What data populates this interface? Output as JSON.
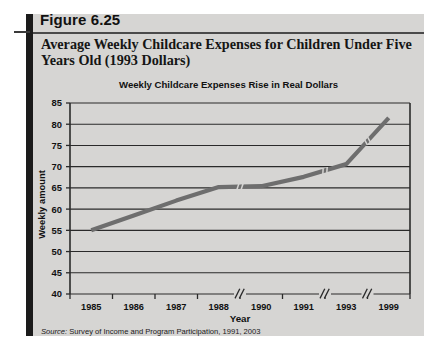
{
  "figure": {
    "number_label": "Figure 6.25",
    "title": "Average Weekly Childcare Expenses for Children Under Five Years Old (1993 Dollars)",
    "source": "Survey of Income and Program Participation, 1991, 2003",
    "source_prefix": "Source:"
  },
  "colors": {
    "panel_background": "#d6d5d3",
    "accent_bar": "#1b1b1b",
    "series_line": "#6e6e6e",
    "gridline": "#2a2a2a",
    "text": "#111111"
  },
  "chart_data": {
    "type": "line",
    "title": "Weekly Childcare Expenses Rise in Real Dollars",
    "xlabel": "Year",
    "ylabel": "Weekly amount",
    "ylim": [
      40,
      85
    ],
    "ytick_step": 5,
    "yticks": [
      "40",
      "45",
      "50",
      "55",
      "60",
      "65",
      "70",
      "75",
      "80",
      "85"
    ],
    "grid": true,
    "legend": "none",
    "categories": [
      "1985",
      "1986",
      "1987",
      "1988",
      "1990",
      "1991",
      "1993",
      "1999"
    ],
    "values": [
      55.0,
      58.5,
      62.0,
      65.2,
      65.4,
      67.6,
      70.6,
      81.5
    ],
    "axis_breaks_after": [
      "1988",
      "1991",
      "1993"
    ],
    "break_glyph": "//",
    "series": [
      {
        "name": "Average weekly childcare expenses (1993 dollars)",
        "values": [
          55.0,
          58.5,
          62.0,
          65.2,
          65.4,
          67.6,
          70.6,
          81.5
        ]
      }
    ]
  }
}
